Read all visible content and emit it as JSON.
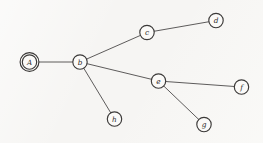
{
  "figure": {
    "background_color": "#f6f5f3",
    "ink_color": "#3b3938",
    "edge_color": "#4c4a49",
    "node_fill": "#fbfaf8",
    "node_radius": 7.2,
    "start_node_outer_radius": 9.4
  },
  "graph": {
    "type": "undirected-tree",
    "node_count": 8,
    "edge_count": 7,
    "nodes": [
      {
        "id": "A",
        "label": "A",
        "x": 29.5,
        "y": 62,
        "double_circle": true
      },
      {
        "id": "b",
        "label": "b",
        "x": 80,
        "y": 62,
        "double_circle": false
      },
      {
        "id": "c",
        "label": "c",
        "x": 147,
        "y": 32.5,
        "double_circle": false
      },
      {
        "id": "d",
        "label": "d",
        "x": 216,
        "y": 20.5,
        "double_circle": false
      },
      {
        "id": "e",
        "label": "e",
        "x": 158.5,
        "y": 81,
        "double_circle": false
      },
      {
        "id": "f",
        "label": "f",
        "x": 241.5,
        "y": 87,
        "double_circle": false
      },
      {
        "id": "g",
        "label": "g",
        "x": 204,
        "y": 124.5,
        "double_circle": false
      },
      {
        "id": "h",
        "label": "h",
        "x": 114.5,
        "y": 119,
        "double_circle": false
      }
    ],
    "edges": [
      {
        "from": "A",
        "to": "b"
      },
      {
        "from": "b",
        "to": "c"
      },
      {
        "from": "c",
        "to": "d"
      },
      {
        "from": "b",
        "to": "e"
      },
      {
        "from": "e",
        "to": "f"
      },
      {
        "from": "e",
        "to": "g"
      },
      {
        "from": "b",
        "to": "h"
      }
    ]
  }
}
